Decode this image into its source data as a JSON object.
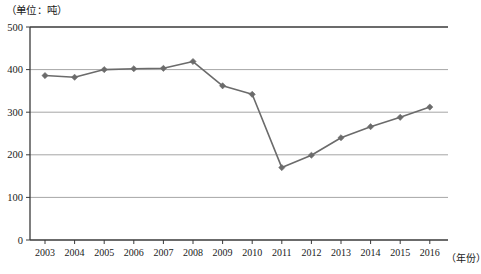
{
  "labels": {
    "unit_note": "（单位：吨）",
    "xaxis_title": "（年份）"
  },
  "style": {
    "series_color": "#6b6b6b",
    "grid_color": "#a6a6a6",
    "axis_color": "#3a3a3a",
    "background": "#ffffff"
  },
  "chart_data": {
    "type": "line",
    "title": "",
    "subtitle": "",
    "xlabel": "（年份）",
    "ylabel": "（单位：吨）",
    "categories": [
      "2003",
      "2004",
      "2005",
      "2006",
      "2007",
      "2008",
      "2009",
      "2010",
      "2011",
      "2012",
      "2013",
      "2014",
      "2015",
      "2016"
    ],
    "values": [
      386,
      382,
      400,
      402,
      403,
      419,
      362,
      342,
      170,
      199,
      240,
      266,
      288,
      312
    ],
    "series": [
      {
        "name": "",
        "values": [
          386,
          382,
          400,
          402,
          403,
          419,
          362,
          342,
          170,
          199,
          240,
          266,
          288,
          312
        ]
      }
    ],
    "ylim": [
      0,
      500
    ],
    "yticks": [
      0,
      100,
      200,
      300,
      400,
      500
    ],
    "ytick_labels": [
      "0",
      "100",
      "200",
      "300",
      "400",
      "500"
    ],
    "grid": true,
    "grid_axis": "y",
    "legend": false,
    "legend_position": "none",
    "marker": "diamond",
    "annotations": []
  }
}
